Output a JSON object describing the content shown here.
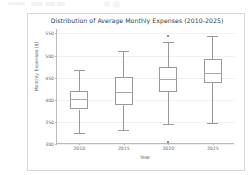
{
  "top_bar": {
    "present": true,
    "description": "faint-ui-remnant"
  },
  "figure": {
    "title": "Distribution of Average Monthly Expenses (2010-2025)",
    "xlabel": "Year",
    "ylabel": "Monthly Expenses ($)",
    "frame_color": "#d8d8d8",
    "line_color": "#9a9a9a",
    "grid_color": "#f0f0f0"
  },
  "chart_data": {
    "type": "box",
    "title": "Distribution of Average Monthly Expenses (2010-2025)",
    "xlabel": "Year",
    "ylabel": "Monthly Expenses ($)",
    "categories": [
      "2010",
      "2015",
      "2020",
      "2025"
    ],
    "ylim": [
      300,
      560
    ],
    "yticks": [
      300,
      350,
      400,
      450,
      500,
      550
    ],
    "ytick_labels": [
      "300",
      "350",
      "400",
      "450",
      "500",
      "550"
    ],
    "grid": true,
    "legend": null,
    "boxes": [
      {
        "category": "2010",
        "whisker_low": 325,
        "q1": 378,
        "median": 402,
        "q3": 420,
        "whisker_high": 467,
        "outliers": []
      },
      {
        "category": "2015",
        "whisker_low": 332,
        "q1": 388,
        "median": 418,
        "q3": 452,
        "whisker_high": 511,
        "outliers": []
      },
      {
        "category": "2020",
        "whisker_low": 345,
        "q1": 418,
        "median": 447,
        "q3": 475,
        "whisker_high": 531,
        "outliers": [
          545,
          304
        ]
      },
      {
        "category": "2025",
        "whisker_low": 348,
        "q1": 437,
        "median": 460,
        "q3": 492,
        "whisker_high": 544,
        "outliers": []
      }
    ]
  }
}
